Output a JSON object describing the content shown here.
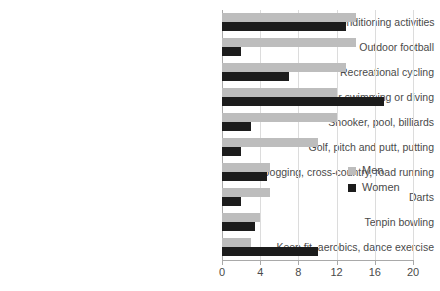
{
  "chart_data": {
    "type": "bar",
    "orientation": "horizontal",
    "title": "",
    "xlabel": "",
    "ylabel": "",
    "xlim": [
      0,
      20
    ],
    "xticks": [
      0,
      4,
      8,
      12,
      16,
      20
    ],
    "xtick_labels": [
      "0",
      "4",
      "8",
      "12",
      "16",
      "20"
    ],
    "grid": true,
    "grid_axis": "x",
    "legend_position": "center-right",
    "categories": [
      "Health, fitness, gym or conditioning activities",
      "Outdoor football",
      "Recreational cycling",
      "Indoor swimming or diving",
      "Snooker, pool, billiards",
      "Golf, pitch and putt, putting",
      "Jogging, cross-country, road running",
      "Darts",
      "Tenpin bowling",
      "Keep fit, aerobics, dance exercise"
    ],
    "series": [
      {
        "name": "Men",
        "color": "#bdbdbd",
        "values": [
          14,
          14,
          13,
          12,
          12,
          10,
          5,
          5,
          4,
          3
        ]
      },
      {
        "name": "Women",
        "color": "#1c1c1c",
        "values": [
          13,
          2,
          7,
          17,
          3,
          2,
          4.7,
          2,
          3.5,
          10
        ]
      }
    ]
  },
  "legend": {
    "entries": [
      {
        "label": "Men",
        "color": "#bdbdbd"
      },
      {
        "label": "Women",
        "color": "#1c1c1c"
      }
    ]
  },
  "colors": {
    "men": "#bdbdbd",
    "women": "#1c1c1c",
    "grid": "#dcdcdc",
    "axis": "#a9a9a9",
    "text": "#4a4a4a",
    "background": "#ffffff"
  }
}
